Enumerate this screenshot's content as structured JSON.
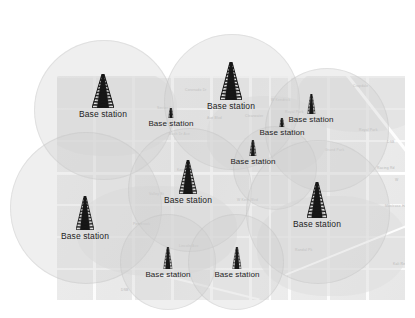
{
  "figure": {
    "kind": "cellular-coverage-map",
    "background_color": "#ffffff",
    "map_fill": "#ebebeb",
    "cell_fill": "rgba(206,206,206,0.33)",
    "cell_stroke": "rgba(190,190,190,0.30)",
    "label_color": "#1e1e1e",
    "map_label_color": "#b9b9b9"
  },
  "map": {
    "x": 57,
    "y": 76,
    "width": 348,
    "height": 224,
    "place_labels": [
      {
        "text": "Coronado Dr",
        "x": 128,
        "y": 12
      },
      {
        "text": "Sector Ct",
        "x": 100,
        "y": 30
      },
      {
        "text": "Ave Blvd",
        "x": 150,
        "y": 40
      },
      {
        "text": "Bush Dr Ave",
        "x": 112,
        "y": 56
      },
      {
        "text": "Clearwater",
        "x": 188,
        "y": 38
      },
      {
        "text": "W Kendrick",
        "x": 214,
        "y": 22
      },
      {
        "text": "Royal Park",
        "x": 228,
        "y": 34
      },
      {
        "text": "Cropdale",
        "x": 296,
        "y": 8
      },
      {
        "text": "Royal Park",
        "x": 302,
        "y": 52
      },
      {
        "text": "Grand Park",
        "x": 268,
        "y": 72
      },
      {
        "text": "DSB",
        "x": 330,
        "y": 64
      },
      {
        "text": "Prince A Oaks",
        "x": 364,
        "y": 58
      },
      {
        "text": "Racing Rd",
        "x": 320,
        "y": 90
      },
      {
        "text": "Montrose Hills Ridge Park",
        "x": 328,
        "y": 128
      },
      {
        "text": "W Kern Blvd",
        "x": 180,
        "y": 122
      },
      {
        "text": "Kerry Ave",
        "x": 120,
        "y": 92
      },
      {
        "text": "Valley St",
        "x": 92,
        "y": 116
      },
      {
        "text": "Pembrook",
        "x": 76,
        "y": 146
      },
      {
        "text": "Lincoln Ave",
        "x": 122,
        "y": 168
      },
      {
        "text": "Randal Pk",
        "x": 238,
        "y": 172
      },
      {
        "text": "Kali Res",
        "x": 336,
        "y": 186
      },
      {
        "text": "DSB",
        "x": 64,
        "y": 212
      },
      {
        "text": "W",
        "x": 338,
        "y": 102
      }
    ]
  },
  "cells": [
    {
      "name": "cell-nw",
      "cx": 104,
      "cy": 110,
      "r": 70
    },
    {
      "name": "cell-north",
      "cx": 232,
      "cy": 102,
      "r": 68
    },
    {
      "name": "cell-northeast",
      "cx": 327,
      "cy": 130,
      "r": 62
    },
    {
      "name": "cell-west",
      "cx": 86,
      "cy": 208,
      "r": 76
    },
    {
      "name": "cell-center",
      "cx": 190,
      "cy": 190,
      "r": 62
    },
    {
      "name": "cell-east-mid",
      "cx": 275,
      "cy": 168,
      "r": 42
    },
    {
      "name": "cell-east",
      "cx": 318,
      "cy": 212,
      "r": 72
    },
    {
      "name": "cell-south-left",
      "cx": 168,
      "cy": 262,
      "r": 48
    },
    {
      "name": "cell-south-right",
      "cx": 236,
      "cy": 262,
      "r": 48
    }
  ],
  "stations": [
    {
      "id": 1,
      "label": "Base station",
      "x": 103,
      "y": 74,
      "tower_h": 34,
      "tower_w": 22,
      "size": "large",
      "label_x": 103,
      "label_y": 118
    },
    {
      "id": 2,
      "label": "Base station",
      "x": 171,
      "y": 108,
      "tower_h": 10,
      "tower_w": 5,
      "size": "small",
      "label_x": 171,
      "label_y": 120
    },
    {
      "id": 3,
      "label": "Base station",
      "x": 231,
      "y": 62,
      "tower_h": 38,
      "tower_w": 22,
      "size": "large",
      "label_x": 231,
      "label_y": 105
    },
    {
      "id": 4,
      "label": "Base station",
      "x": 311,
      "y": 94,
      "tower_h": 20,
      "tower_w": 8,
      "size": "medium",
      "label_x": 311,
      "label_y": 117
    },
    {
      "id": 5,
      "label": "Base station",
      "x": 282,
      "y": 118,
      "tower_h": 9,
      "tower_w": 5,
      "size": "small",
      "label_x": 282,
      "label_y": 131
    },
    {
      "id": 6,
      "label": "Base station",
      "x": 253,
      "y": 140,
      "tower_h": 16,
      "tower_w": 7,
      "size": "medium",
      "label_x": 253,
      "label_y": 158
    },
    {
      "id": 7,
      "label": "Base station",
      "x": 188,
      "y": 160,
      "tower_h": 34,
      "tower_w": 18,
      "size": "large",
      "label_x": 188,
      "label_y": 198
    },
    {
      "id": 8,
      "label": "Base station",
      "x": 85,
      "y": 196,
      "tower_h": 34,
      "tower_w": 18,
      "size": "large",
      "label_x": 85,
      "label_y": 234
    },
    {
      "id": 9,
      "label": "Base station",
      "x": 317,
      "y": 182,
      "tower_h": 36,
      "tower_w": 20,
      "size": "large",
      "label_x": 317,
      "label_y": 222
    },
    {
      "id": 10,
      "label": "Base station",
      "x": 168,
      "y": 247,
      "tower_h": 22,
      "tower_w": 9,
      "size": "medium",
      "label_x": 168,
      "label_y": 272
    },
    {
      "id": 11,
      "label": "Base station",
      "x": 237,
      "y": 247,
      "tower_h": 22,
      "tower_w": 9,
      "size": "medium",
      "label_x": 237,
      "label_y": 272
    }
  ]
}
